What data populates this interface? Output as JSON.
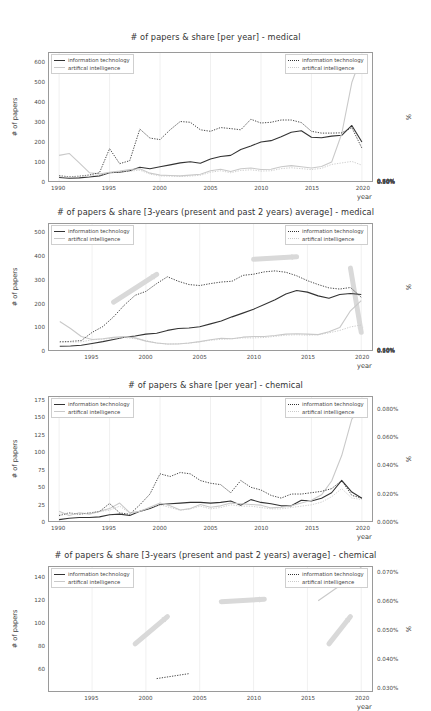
{
  "page": {
    "background": "#ffffff",
    "kind": "matplotlib-figure-stack",
    "figure_count": 4
  },
  "colors": {
    "information_technology": "#333333",
    "artificial_intelligence": "#c9c9c9",
    "annotation_arrow": "#d9d9d9",
    "axis": "#9a9a9a",
    "grid": "#ececec",
    "text": "#3a3a3a"
  },
  "legend": {
    "left": {
      "items": [
        {
          "label": "information technology",
          "style": "solid",
          "color_key": "information_technology"
        },
        {
          "label": "artifical intelligence",
          "style": "solid",
          "color_key": "artificial_intelligence"
        }
      ]
    },
    "right": {
      "items": [
        {
          "label": "information technology",
          "style": "dotted",
          "color_key": "information_technology"
        },
        {
          "label": "artifical intelligence",
          "style": "dotted",
          "color_key": "artificial_intelligence"
        }
      ]
    }
  },
  "chart_data": [
    {
      "id": "medical-per-year",
      "type": "line",
      "title": "# of papers & share [per year] - medical",
      "xlabel": "year",
      "ylabel": "# of papers",
      "y2label": "%",
      "xlim": [
        1989,
        2021
      ],
      "ylim": [
        0,
        650
      ],
      "y2lim": [
        0,
        0.85
      ],
      "grid": true,
      "legend_position": "top-left and top-right",
      "xticks": [
        1990,
        1995,
        2000,
        2005,
        2010,
        2015,
        2020
      ],
      "yticks": [
        0,
        100,
        200,
        300,
        400,
        500,
        600
      ],
      "y2ticks": [
        "0.10%",
        "0.20%",
        "0.30%",
        "0.40%",
        "0.50%",
        "0.60%",
        "0.70%",
        "0.80%"
      ],
      "x": [
        1990,
        1991,
        1992,
        1993,
        1994,
        1995,
        1996,
        1997,
        1998,
        1999,
        2000,
        2001,
        2002,
        2003,
        2004,
        2005,
        2006,
        2007,
        2008,
        2009,
        2010,
        2011,
        2012,
        2013,
        2014,
        2015,
        2016,
        2017,
        2018,
        2019,
        2020
      ],
      "series": [
        {
          "name": "information technology",
          "axis": "left",
          "style": "solid",
          "values": [
            18,
            14,
            16,
            20,
            26,
            42,
            45,
            52,
            70,
            62,
            72,
            82,
            92,
            98,
            90,
            112,
            124,
            130,
            160,
            178,
            198,
            205,
            225,
            248,
            255,
            222,
            220,
            228,
            232,
            282,
            198
          ]
        },
        {
          "name": "artifical intelligence",
          "axis": "left",
          "style": "solid",
          "values": [
            130,
            140,
            92,
            42,
            36,
            44,
            50,
            58,
            62,
            40,
            30,
            28,
            26,
            30,
            34,
            52,
            60,
            48,
            62,
            66,
            58,
            60,
            72,
            78,
            72,
            66,
            74,
            96,
            240,
            500,
            640
          ]
        },
        {
          "name": "information technology",
          "axis": "right",
          "style": "dotted",
          "values": [
            0.035,
            0.028,
            0.032,
            0.04,
            0.055,
            0.215,
            0.115,
            0.135,
            0.345,
            0.285,
            0.275,
            0.34,
            0.395,
            0.39,
            0.34,
            0.33,
            0.355,
            0.348,
            0.34,
            0.41,
            0.385,
            0.39,
            0.405,
            0.405,
            0.388,
            0.33,
            0.318,
            0.318,
            0.32,
            0.355,
            0.218
          ]
        },
        {
          "name": "artifical intelligence",
          "axis": "right",
          "style": "dotted",
          "values": [
            0.03,
            0.026,
            0.03,
            0.035,
            0.038,
            0.056,
            0.06,
            0.065,
            0.072,
            0.046,
            0.034,
            0.032,
            0.03,
            0.033,
            0.038,
            0.058,
            0.068,
            0.055,
            0.07,
            0.074,
            0.066,
            0.068,
            0.082,
            0.088,
            0.082,
            0.076,
            0.084,
            0.11,
            0.12,
            0.13,
            0.105
          ]
        }
      ],
      "annotations": []
    },
    {
      "id": "medical-3yr-average",
      "type": "line",
      "title": "# of papers & share [3-years (present and past 2 years) average] - medical",
      "xlabel": "year",
      "ylabel": "# of papers",
      "y2label": "%",
      "xlim": [
        1991,
        2021
      ],
      "ylim": [
        0,
        540
      ],
      "y2lim": [
        0,
        0.645
      ],
      "grid": true,
      "legend_position": "top-left and top-right",
      "xticks": [
        1995,
        2000,
        2005,
        2010,
        2015,
        2020
      ],
      "yticks": [
        0,
        100,
        200,
        300,
        400,
        500
      ],
      "y2ticks": [
        "0.10%",
        "0.20%",
        "0.30%",
        "0.40%",
        "0.50%",
        "0.60%"
      ],
      "x": [
        1992,
        1993,
        1994,
        1995,
        1996,
        1997,
        1998,
        1999,
        2000,
        2001,
        2002,
        2003,
        2004,
        2005,
        2006,
        2007,
        2008,
        2009,
        2010,
        2011,
        2012,
        2013,
        2014,
        2015,
        2016,
        2017,
        2018,
        2019,
        2020
      ],
      "series": [
        {
          "name": "information technology",
          "axis": "left",
          "style": "solid",
          "values": [
            16,
            17,
            20,
            28,
            36,
            45,
            55,
            60,
            68,
            72,
            84,
            92,
            94,
            100,
            112,
            124,
            142,
            158,
            175,
            195,
            215,
            240,
            255,
            248,
            232,
            222,
            238,
            242,
            238
          ]
        },
        {
          "name": "artifical intelligence",
          "axis": "left",
          "style": "solid",
          "values": [
            122,
            92,
            58,
            45,
            48,
            54,
            58,
            52,
            38,
            30,
            26,
            26,
            30,
            36,
            44,
            50,
            48,
            55,
            58,
            58,
            62,
            68,
            70,
            68,
            66,
            78,
            96,
            168,
            212
          ]
        },
        {
          "name": "information technology",
          "axis": "right",
          "style": "dotted",
          "values": [
            0.042,
            0.044,
            0.048,
            0.09,
            0.12,
            0.17,
            0.23,
            0.28,
            0.3,
            0.34,
            0.375,
            0.352,
            0.335,
            0.33,
            0.34,
            0.348,
            0.352,
            0.382,
            0.388,
            0.4,
            0.405,
            0.398,
            0.38,
            0.355,
            0.335,
            0.318,
            0.312,
            0.32,
            0.27
          ]
        },
        {
          "name": "artifical intelligence",
          "axis": "right",
          "style": "dotted",
          "values": [
            0.038,
            0.04,
            0.042,
            0.052,
            0.056,
            0.06,
            0.064,
            0.058,
            0.048,
            0.036,
            0.03,
            0.032,
            0.035,
            0.042,
            0.05,
            0.055,
            0.058,
            0.062,
            0.062,
            0.064,
            0.07,
            0.076,
            0.078,
            0.076,
            0.078,
            0.088,
            0.1,
            0.118,
            0.128
          ]
        }
      ],
      "annotations": [
        {
          "kind": "arrow",
          "direction": "up-right",
          "from_year": 1997,
          "to_year": 2001,
          "note": "rising trend marker"
        },
        {
          "kind": "arrow",
          "direction": "right",
          "from_year": 2010,
          "to_year": 2014,
          "note": "plateau marker"
        },
        {
          "kind": "arrow",
          "direction": "down",
          "from_year": 2019,
          "to_year": 2020,
          "note": "decline marker"
        }
      ]
    },
    {
      "id": "chemical-per-year",
      "type": "line",
      "title": "# of papers & share [per year] - chemical",
      "xlabel": "year",
      "ylabel": "# of papers",
      "y2label": "%",
      "xlim": [
        1989,
        2021
      ],
      "ylim": [
        0,
        180
      ],
      "y2lim": [
        0,
        0.092
      ],
      "grid": true,
      "legend_position": "top-left and top-right",
      "xticks": [
        1990,
        1995,
        2000,
        2005,
        2010,
        2015,
        2020
      ],
      "yticks": [
        0,
        25,
        50,
        75,
        100,
        125,
        150,
        175
      ],
      "y2ticks": [
        "0.000%",
        "0.020%",
        "0.040%",
        "0.060%",
        "0.080%"
      ],
      "x": [
        1990,
        1991,
        1992,
        1993,
        1994,
        1995,
        1996,
        1997,
        1998,
        1999,
        2000,
        2001,
        2002,
        2003,
        2004,
        2005,
        2006,
        2007,
        2008,
        2009,
        2010,
        2011,
        2012,
        2013,
        2014,
        2015,
        2016,
        2017,
        2018,
        2019,
        2020
      ],
      "series": [
        {
          "name": "information technology",
          "axis": "left",
          "style": "solid",
          "values": [
            2,
            4,
            5,
            5,
            6,
            9,
            10,
            8,
            14,
            18,
            24,
            25,
            26,
            27,
            27,
            26,
            27,
            29,
            23,
            31,
            27,
            25,
            22,
            22,
            30,
            29,
            33,
            41,
            59,
            42,
            33
          ]
        },
        {
          "name": "artifical intelligence",
          "axis": "left",
          "style": "solid",
          "values": [
            14,
            8,
            12,
            10,
            14,
            18,
            26,
            12,
            14,
            20,
            26,
            22,
            16,
            18,
            24,
            20,
            22,
            26,
            25,
            24,
            23,
            19,
            20,
            22,
            26,
            30,
            38,
            58,
            95,
            148,
            166
          ]
        },
        {
          "name": "information technology",
          "axis": "right",
          "style": "dotted",
          "values": [
            0.004,
            0.006,
            0.005,
            0.006,
            0.007,
            0.013,
            0.006,
            0.005,
            0.012,
            0.02,
            0.035,
            0.033,
            0.036,
            0.035,
            0.03,
            0.028,
            0.027,
            0.021,
            0.03,
            0.025,
            0.023,
            0.019,
            0.017,
            0.02,
            0.02,
            0.021,
            0.022,
            0.024,
            0.03,
            0.019,
            0.017
          ]
        },
        {
          "name": "artifical intelligence",
          "axis": "right",
          "style": "dotted",
          "values": [
            0.005,
            0.006,
            0.005,
            0.006,
            0.007,
            0.008,
            0.011,
            0.006,
            0.007,
            0.01,
            0.012,
            0.01,
            0.008,
            0.009,
            0.011,
            0.009,
            0.01,
            0.012,
            0.011,
            0.011,
            0.01,
            0.009,
            0.009,
            0.01,
            0.011,
            0.012,
            0.014,
            0.018,
            0.024,
            0.017,
            0.016
          ]
        }
      ],
      "annotations": []
    },
    {
      "id": "chemical-3yr-average",
      "type": "line",
      "title": "# of papers & share [3-years (present and past 2 years) average] - chemical",
      "xlabel": "year",
      "ylabel": "# of papers",
      "y2label": "%",
      "xlim": [
        1991,
        2021
      ],
      "ylim": [
        40,
        150
      ],
      "y2lim": [
        0.025,
        0.075
      ],
      "grid": true,
      "legend_position": "top-left and top-right",
      "xticks": [
        1995,
        2000,
        2005,
        2010,
        2015,
        2020
      ],
      "yticks": [
        60,
        80,
        100,
        120,
        140
      ],
      "y2ticks": [
        "0.030%",
        "0.040%",
        "0.050%",
        "0.060%",
        "0.070%"
      ],
      "x": [
        1992,
        1995,
        1998,
        2001,
        2004,
        2007,
        2010,
        2013,
        2016,
        2019,
        2020
      ],
      "series": [
        {
          "name": "information technology",
          "axis": "left",
          "style": "solid",
          "values": [
            null,
            null,
            null,
            null,
            null,
            null,
            null,
            null,
            null,
            null,
            null
          ]
        },
        {
          "name": "artifical intelligence",
          "axis": "left",
          "style": "solid",
          "values": [
            null,
            null,
            null,
            null,
            null,
            null,
            null,
            null,
            120,
            140,
            150
          ]
        },
        {
          "name": "information technology",
          "axis": "right",
          "style": "dotted",
          "values": [
            null,
            null,
            null,
            0.03,
            0.032,
            null,
            null,
            null,
            null,
            null,
            null
          ]
        },
        {
          "name": "artifical intelligence",
          "axis": "right",
          "style": "dotted",
          "values": [
            null,
            null,
            null,
            null,
            null,
            null,
            null,
            null,
            null,
            null,
            null
          ]
        }
      ],
      "annotations": [
        {
          "kind": "arrow",
          "direction": "up-right",
          "from_year": 1999,
          "to_year": 2002,
          "note": "rising trend marker"
        },
        {
          "kind": "arrow",
          "direction": "right",
          "from_year": 2007,
          "to_year": 2011,
          "note": "plateau marker"
        },
        {
          "kind": "arrow",
          "direction": "up-right",
          "from_year": 2017,
          "to_year": 2019,
          "note": "surge marker"
        }
      ],
      "clipped": true
    }
  ]
}
